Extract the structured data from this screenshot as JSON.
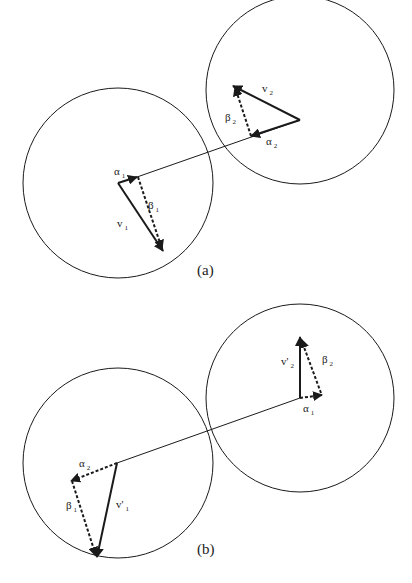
{
  "panels": [
    {
      "caption": "(a)",
      "labels": {
        "v1": "v",
        "v1_sub": "1",
        "v2": "v",
        "v2_sub": "2",
        "alpha1": "α",
        "alpha1_sub": "1",
        "alpha2": "α",
        "alpha2_sub": "2",
        "beta1": "β",
        "beta1_sub": "1",
        "beta2": "β",
        "beta2_sub": "2"
      }
    },
    {
      "caption": "(b)",
      "labels": {
        "v1p": "v'",
        "v1p_sub": "1",
        "v2p": "v'",
        "v2p_sub": "2",
        "alpha1": "α",
        "alpha1_sub": "1",
        "alpha2": "α",
        "alpha2_sub": "2",
        "beta1": "β",
        "beta1_sub": "1",
        "beta2": "β",
        "beta2_sub": "2"
      }
    }
  ],
  "colors": {
    "stroke": "#1a1a1a",
    "background": "#ffffff"
  }
}
